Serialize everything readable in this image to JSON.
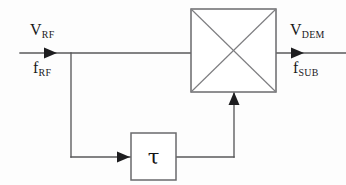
{
  "diagram": {
    "type": "block-diagram",
    "background_color": "#fdfdfd",
    "line_color": "#58585a",
    "text_color": "#18181a",
    "canvas": {
      "width": 346,
      "height": 185
    },
    "labels": {
      "input_voltage": {
        "base": "V",
        "sub": "RF"
      },
      "input_frequency": {
        "base": "f",
        "sub": "RF"
      },
      "output_voltage": {
        "base": "V",
        "sub": "DEM"
      },
      "output_frequency": {
        "base": "f",
        "sub": "SUB"
      },
      "delay_symbol": "τ"
    },
    "blocks": [
      {
        "name": "mixer",
        "shape": "square-with-x",
        "x": 191,
        "y": 9,
        "width": 85,
        "height": 83,
        "label": ""
      },
      {
        "name": "delay",
        "shape": "rectangle",
        "x": 131,
        "y": 133,
        "width": 45,
        "height": 47,
        "label": "τ"
      }
    ],
    "signal_paths": [
      {
        "name": "rf-input-path",
        "from": "left-edge",
        "to": "mixer-rf-port",
        "y": 53,
        "arrow": true
      },
      {
        "name": "demodulated-output-path",
        "from": "mixer-if-port",
        "to": "right-edge",
        "y": 53,
        "arrow": true
      },
      {
        "name": "delay-tap-path",
        "from": "rf-line-junction",
        "to": "delay-input",
        "arrow": true
      },
      {
        "name": "delay-to-lo-path",
        "from": "delay-output",
        "to": "mixer-lo-port",
        "arrow": true
      }
    ]
  }
}
